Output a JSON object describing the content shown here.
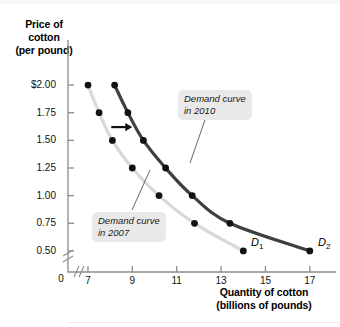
{
  "figure": {
    "y_axis_title": "Price of\ncotton\n(per pound)",
    "x_axis_title": "Quantity of cotton\n(billions of pounds)",
    "origin_label": "0",
    "callout_2010": "Demand curve\nin 2010",
    "callout_2007": "Demand curve\nin 2007",
    "tag_d1": "D",
    "tag_d1_sub": "1",
    "tag_d2": "D",
    "tag_d2_sub": "2"
  },
  "colors": {
    "curve_2007": "#d9d9d9",
    "curve_2010": "#3f3f3f",
    "point": "#111111",
    "axis": "#8c8c8c",
    "callout_bg": "#e9e9e9",
    "text": "#000000"
  },
  "chart_data": {
    "type": "line",
    "title": "",
    "xlabel": "Quantity of cotton (billions of pounds)",
    "ylabel": "Price of cotton (per pound)",
    "xlim": [
      6.1,
      18.0
    ],
    "ylim": [
      0.4,
      2.1
    ],
    "grid": false,
    "legend_position": "inline-callouts",
    "x_ticks": [
      7,
      9,
      11,
      13,
      15,
      17
    ],
    "x_tick_labels": [
      "7",
      "9",
      "11",
      "13",
      "15",
      "17"
    ],
    "y_ticks": [
      0.5,
      0.75,
      1.0,
      1.25,
      1.5,
      1.75,
      2.0
    ],
    "y_tick_labels": [
      "0.50",
      "0.75",
      "1.00",
      "1.25",
      "1.50",
      "1.75",
      "$2.00"
    ],
    "axis_break_x": true,
    "axis_break_y": true,
    "annotations": [
      {
        "text": "Demand curve in 2010",
        "target_series": "D2"
      },
      {
        "text": "Demand curve in 2007",
        "target_series": "D1"
      },
      {
        "text": "shift-arrow",
        "type": "arrow",
        "direction": "right",
        "x_from": 8.05,
        "x_to": 9.0,
        "y": 1.62
      }
    ],
    "series": [
      {
        "name": "D1",
        "label": "Demand curve in 2007",
        "color": "#d9d9d9",
        "points": [
          {
            "x": 7.0,
            "y": 2.0
          },
          {
            "x": 7.5,
            "y": 1.75
          },
          {
            "x": 8.1,
            "y": 1.5
          },
          {
            "x": 9.0,
            "y": 1.25
          },
          {
            "x": 10.2,
            "y": 1.0
          },
          {
            "x": 11.8,
            "y": 0.75
          },
          {
            "x": 14.0,
            "y": 0.5
          }
        ]
      },
      {
        "name": "D2",
        "label": "Demand curve in 2010",
        "color": "#3f3f3f",
        "points": [
          {
            "x": 8.2,
            "y": 2.0
          },
          {
            "x": 8.8,
            "y": 1.75
          },
          {
            "x": 9.5,
            "y": 1.5
          },
          {
            "x": 10.5,
            "y": 1.25
          },
          {
            "x": 11.7,
            "y": 1.0
          },
          {
            "x": 13.4,
            "y": 0.75
          },
          {
            "x": 17.0,
            "y": 0.5
          }
        ]
      }
    ]
  }
}
